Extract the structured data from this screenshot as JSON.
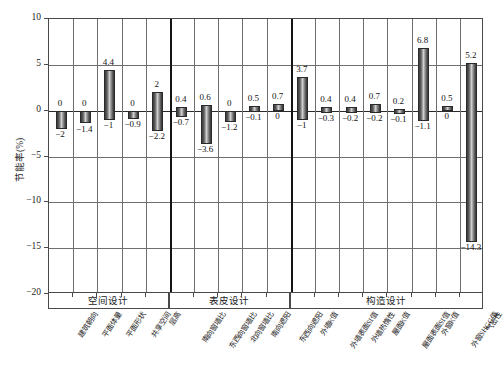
{
  "chart_data": {
    "type": "bar",
    "title": "",
    "xlabel": "",
    "ylabel": "节能率(%)",
    "ylim": [
      -20,
      10
    ],
    "yticks": [
      10,
      5,
      0,
      -5,
      -10,
      -15,
      -20
    ],
    "ytick_labels": [
      "10",
      "5",
      "0",
      "-5",
      "-10",
      "-15",
      "-20"
    ],
    "grid": true,
    "legend": "none",
    "note": "Floating (high-low) bars: each category spans from its negative value to its positive value.",
    "categories": [
      "建筑朝向",
      "平面体量",
      "平面形状",
      "共享空间",
      "层高",
      "南向窗墙比",
      "东西向窗墙比",
      "北向窗墙比",
      "南向遮阳",
      "东西向遮阳",
      "外墙K值",
      "外墙表面SI值",
      "外墙热惰性",
      "屋面K值",
      "屋面表面SI值",
      "外窗K值",
      "外窗SHGC值",
      "气密性"
    ],
    "series": [
      {
        "name": "上限 (max)",
        "values": [
          0,
          0,
          4.4,
          0,
          2,
          0.4,
          0.6,
          0,
          0.5,
          0.7,
          3.7,
          0.4,
          0.4,
          0.7,
          0.2,
          6.8,
          0.5,
          5.2
        ]
      },
      {
        "name": "下限 (min)",
        "values": [
          -2,
          -1.4,
          -1,
          -0.9,
          -2.2,
          -0.7,
          -3.6,
          -1.2,
          -0.1,
          0,
          -1,
          -0.3,
          -0.2,
          -0.2,
          -0.1,
          -1.1,
          0,
          -14.3
        ]
      }
    ],
    "top_labels": [
      "0",
      "0",
      "4.4",
      "0",
      "2",
      "0.4",
      "0.6",
      "0",
      "0.5",
      "0.7",
      "3.7",
      "0.4",
      "0.4",
      "0.7",
      "0.2",
      "6.8",
      "0.5",
      "5.2"
    ],
    "bottom_labels": [
      "-2",
      "-1.4",
      "-1",
      "-0.9",
      "-2.2",
      "-0.7",
      "-3.6",
      "-1.2",
      "-0.1",
      "0",
      "-1",
      "-0.3",
      "-0.2",
      "-0.2",
      "-0.1",
      "-1.1",
      "0",
      "-14.3"
    ],
    "groups": [
      {
        "label": "空间设计",
        "start": 0,
        "end": 4
      },
      {
        "label": "表皮设计",
        "start": 5,
        "end": 9
      },
      {
        "label": "构造设计",
        "start": 10,
        "end": 17
      }
    ],
    "colors": {
      "bar_dark": "#333333",
      "bar_light": "#cfcfcf",
      "axis": "#4a4a4a",
      "grid": "#6f6f6f",
      "zero_line": "#2b2b2b",
      "text": "#1a1a1a"
    }
  }
}
